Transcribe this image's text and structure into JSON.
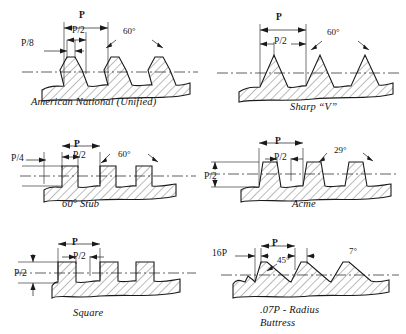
{
  "figure": {
    "line_color": "#1a1a1a",
    "background": "#ffffff"
  },
  "panels": [
    {
      "id": "american-national-unified",
      "caption": "American National (Unified)",
      "dimensions": [
        {
          "name": "pitch",
          "label": "P"
        },
        {
          "name": "half-pitch",
          "label": "P/2"
        },
        {
          "name": "crest-flat",
          "label": "P/8"
        }
      ],
      "angles": [
        {
          "name": "thread-angle",
          "label": "60°"
        }
      ]
    },
    {
      "id": "sharp-v",
      "caption": "Sharp “V”",
      "dimensions": [
        {
          "name": "pitch",
          "label": "P"
        },
        {
          "name": "half-pitch",
          "label": "P/2"
        }
      ],
      "angles": [
        {
          "name": "thread-angle",
          "label": "60°"
        }
      ]
    },
    {
      "id": "sixty-degree-stub",
      "caption": "60° Stub",
      "dimensions": [
        {
          "name": "pitch",
          "label": "P"
        },
        {
          "name": "half-pitch",
          "label": "P/2"
        },
        {
          "name": "thread-depth",
          "label": "P/4"
        }
      ],
      "angles": [
        {
          "name": "thread-angle",
          "label": "60°"
        }
      ]
    },
    {
      "id": "acme",
      "caption": "Acme",
      "dimensions": [
        {
          "name": "pitch",
          "label": "P"
        },
        {
          "name": "half-pitch",
          "label": "P/2"
        },
        {
          "name": "thread-depth",
          "label": "P/2"
        }
      ],
      "angles": [
        {
          "name": "flank-angle",
          "label": "29°"
        }
      ]
    },
    {
      "id": "square",
      "caption": "Square",
      "dimensions": [
        {
          "name": "pitch",
          "label": "P"
        },
        {
          "name": "half-pitch",
          "label": "P/2"
        },
        {
          "name": "thread-depth",
          "label": "P/2"
        }
      ],
      "angles": []
    },
    {
      "id": "buttress",
      "caption": ".07P - Radius\nButtress",
      "caption_line_1": ".07P - Radius",
      "caption_line_2": "Buttress",
      "dimensions": [
        {
          "name": "pitch",
          "label": "P"
        },
        {
          "name": "crest-flat",
          "label": "16P"
        }
      ],
      "angles": [
        {
          "name": "pressure-flank-angle",
          "label": "45°"
        },
        {
          "name": "clearance-flank-angle",
          "label": "7°"
        }
      ]
    }
  ]
}
